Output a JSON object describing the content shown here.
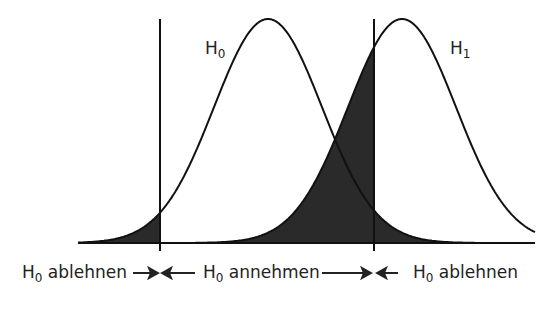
{
  "diagram": {
    "curves": [
      {
        "name": "H",
        "sub": "0",
        "mean_x": 268,
        "sigma": 54
      },
      {
        "name": "H",
        "sub": "1",
        "mean_x": 402,
        "sigma": 54
      }
    ],
    "critical_lines_x": [
      160,
      374
    ],
    "bottom_labels": [
      {
        "text": "H",
        "sub": "0",
        "rest": " ablehnen"
      },
      {
        "text": "H",
        "sub": "0",
        "rest": " annehmen"
      },
      {
        "text": "H",
        "sub": "0",
        "rest": " ablehnen"
      }
    ],
    "fill_color": "#2a2a2a"
  }
}
